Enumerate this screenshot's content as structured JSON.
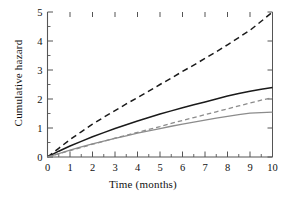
{
  "chart_data": {
    "type": "line",
    "title": "",
    "xlabel": "Time (months)",
    "ylabel": "Cumulative hazard",
    "xlim": [
      0,
      10
    ],
    "ylim": [
      0,
      5
    ],
    "xticks": [
      "0",
      "1",
      "2",
      "3",
      "4",
      "5",
      "6",
      "7",
      "8",
      "9",
      "10"
    ],
    "yticks": [
      "0",
      "1",
      "2",
      "3",
      "4",
      "5"
    ],
    "xtick_values": [
      0,
      1,
      2,
      3,
      4,
      5,
      6,
      7,
      8,
      9,
      10
    ],
    "ytick_values": [
      0,
      1,
      2,
      3,
      4,
      5
    ],
    "minor_xticks": true,
    "minor_yticks": true,
    "grid": false,
    "legend": "none",
    "x": [
      0,
      0.5,
      1,
      1.5,
      2,
      2.5,
      3,
      3.5,
      4,
      4.5,
      5,
      5.5,
      6,
      6.5,
      7,
      7.5,
      8,
      8.5,
      9,
      9.5,
      10
    ],
    "series": [
      {
        "name": "upper-dashed-black",
        "style": "dashed",
        "color": "#1a1a1a",
        "width": 1.5,
        "values": [
          0,
          0.3,
          0.6,
          0.87,
          1.13,
          1.37,
          1.6,
          1.83,
          2.05,
          2.27,
          2.5,
          2.72,
          2.95,
          3.17,
          3.4,
          3.63,
          3.87,
          4.12,
          4.37,
          4.68,
          5.0
        ]
      },
      {
        "name": "solid-black",
        "style": "solid",
        "color": "#1a1a1a",
        "width": 1.5,
        "values": [
          0,
          0.2,
          0.38,
          0.54,
          0.7,
          0.84,
          0.98,
          1.11,
          1.24,
          1.36,
          1.48,
          1.59,
          1.7,
          1.8,
          1.9,
          2.0,
          2.1,
          2.19,
          2.27,
          2.34,
          2.4
        ]
      },
      {
        "name": "dashed-gray",
        "style": "dashed",
        "color": "#8c8c8c",
        "width": 1.3,
        "values": [
          0,
          0.11,
          0.22,
          0.33,
          0.44,
          0.54,
          0.65,
          0.75,
          0.85,
          0.95,
          1.05,
          1.16,
          1.26,
          1.36,
          1.46,
          1.56,
          1.66,
          1.76,
          1.86,
          1.96,
          2.05
        ]
      },
      {
        "name": "solid-gray",
        "style": "solid",
        "color": "#8c8c8c",
        "width": 1.3,
        "values": [
          0,
          0.12,
          0.24,
          0.35,
          0.45,
          0.55,
          0.64,
          0.73,
          0.82,
          0.9,
          0.98,
          1.06,
          1.13,
          1.2,
          1.27,
          1.34,
          1.4,
          1.46,
          1.51,
          1.53,
          1.55
        ]
      }
    ]
  },
  "axes": {
    "xlabel": "Time (months)",
    "ylabel": "Cumulative hazard"
  },
  "colors": {
    "background": "#ffffff",
    "axis": "#555555",
    "black_series": "#1a1a1a",
    "gray_series": "#8c8c8c",
    "text": "#111111"
  }
}
